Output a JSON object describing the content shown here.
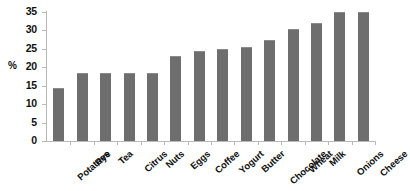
{
  "chart_data": {
    "type": "bar",
    "title": "",
    "subtitle": "",
    "xlabel": "",
    "ylabel": "%",
    "ylim": [
      0,
      35
    ],
    "yticks": [
      0,
      5,
      10,
      15,
      20,
      25,
      30,
      35
    ],
    "ytick_labels": [
      "0",
      "5",
      "10",
      "15",
      "20",
      "25",
      "30",
      "35"
    ],
    "grid": false,
    "legend": null,
    "legend_position": "none",
    "bar_color": "#6e6e6e",
    "axis_color": "#b9b9b9",
    "text_color": "#111111",
    "background_color": "#ffffff",
    "categories": [
      "Potatoes",
      "Rye",
      "Tea",
      "Citrus",
      "Nuts",
      "Eggs",
      "Coffee",
      "Yogurt",
      "Butter",
      "Chocolate",
      "Wheat",
      "Milk",
      "Onions",
      "Cheese"
    ],
    "values": [
      14.5,
      18.5,
      18.5,
      18.5,
      18.5,
      23.0,
      24.5,
      25.0,
      25.5,
      27.5,
      30.5,
      32.0,
      35.0,
      35.0
    ],
    "annotations": []
  }
}
